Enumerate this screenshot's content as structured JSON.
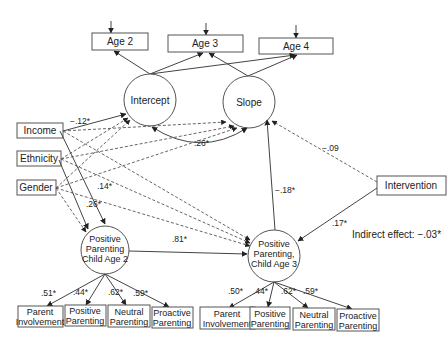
{
  "diagram": {
    "type": "structural-equation-model",
    "outcomes": {
      "age2": "Age 2",
      "age3": "Age 3",
      "age4": "Age 4"
    },
    "latent_growth": {
      "intercept": "Intercept",
      "slope": "Slope"
    },
    "covariates": {
      "income": "Income",
      "ethnicity": "Ethnicity",
      "gender": "Gender"
    },
    "intervention": "Intervention",
    "pp_age2": {
      "line1": "Positive",
      "line2": "Parenting",
      "line3": "Child Age 2"
    },
    "pp_age3": {
      "line1": "Positive",
      "line2": "Parenting,",
      "line3": "Child Age 3"
    },
    "indicators_age2": [
      {
        "line1": "Parent",
        "line2": "Involvement",
        "loading": ".51*"
      },
      {
        "line1": "Positive",
        "line2": "Parenting",
        "loading": ".44*"
      },
      {
        "line1": "Neutral",
        "line2": "Parenting",
        "loading": ".62*"
      },
      {
        "line1": "Proactive",
        "line2": "Parenting",
        "loading": ".59*"
      }
    ],
    "indicators_age3": [
      {
        "line1": "Parent",
        "line2": "Involvement",
        "loading": ".50*"
      },
      {
        "line1": "Positive",
        "line2": "Parenting",
        "loading": ".44*"
      },
      {
        "line1": "Neutral",
        "line2": "Parenting",
        "loading": ".62*"
      },
      {
        "line1": "Proactive",
        "line2": "Parenting",
        "loading": ".59*"
      }
    ],
    "paths": {
      "income_intercept": "−.12*",
      "intercept_slope_cov": ".26*",
      "income_pp2": ".14*",
      "ethnicity_pp2": ".26*",
      "pp2_pp3": ".81*",
      "pp3_slope": "−.18*",
      "intervention_slope": "−.09",
      "intervention_pp3": ".17*"
    },
    "indirect_effect": "Indirect effect:  −.03*"
  }
}
